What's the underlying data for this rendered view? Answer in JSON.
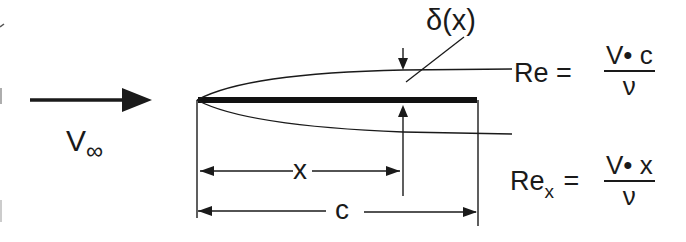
{
  "diagram": {
    "freestream": {
      "label_main": "V",
      "label_sub": "∞"
    },
    "boundary_layer": {
      "label": "δ(x)"
    },
    "dimensions": {
      "x_label": "x",
      "c_label": "c"
    },
    "equations": {
      "re": {
        "lhs": "Re =",
        "numerator": "V• c",
        "denominator": "ν"
      },
      "re_x": {
        "lhs_main": "Re",
        "lhs_sub": "x",
        "equals": "=",
        "numerator": "V• x",
        "denominator": "ν"
      }
    },
    "colors": {
      "ink": "#1a1a1a",
      "background": "#ffffff"
    }
  }
}
